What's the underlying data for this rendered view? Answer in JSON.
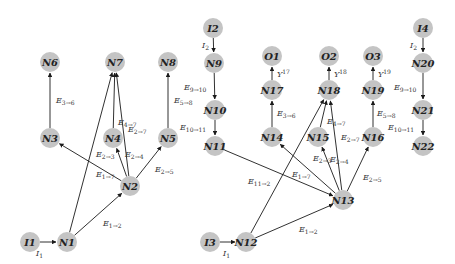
{
  "diagram": {
    "node_color": "#c4c4c4",
    "nodes": [
      {
        "id": "N6",
        "x": 50,
        "y": 62
      },
      {
        "id": "N7",
        "x": 115,
        "y": 62
      },
      {
        "id": "N8",
        "x": 168,
        "y": 62
      },
      {
        "id": "N3",
        "x": 50,
        "y": 138
      },
      {
        "id": "N4",
        "x": 113,
        "y": 138
      },
      {
        "id": "N5",
        "x": 168,
        "y": 138
      },
      {
        "id": "N2",
        "x": 130,
        "y": 186
      },
      {
        "id": "I1",
        "x": 30,
        "y": 242
      },
      {
        "id": "N1",
        "x": 67,
        "y": 242
      },
      {
        "id": "I2",
        "x": 213,
        "y": 28
      },
      {
        "id": "N9",
        "x": 214,
        "y": 63
      },
      {
        "id": "N10",
        "x": 215,
        "y": 110
      },
      {
        "id": "N11",
        "x": 215,
        "y": 146
      },
      {
        "id": "O1",
        "x": 272,
        "y": 56
      },
      {
        "id": "N17",
        "x": 272,
        "y": 90
      },
      {
        "id": "N14",
        "x": 272,
        "y": 137
      },
      {
        "id": "O2",
        "x": 329,
        "y": 56
      },
      {
        "id": "N18",
        "x": 329,
        "y": 90
      },
      {
        "id": "N15",
        "x": 318,
        "y": 137
      },
      {
        "id": "O3",
        "x": 373,
        "y": 56
      },
      {
        "id": "N19",
        "x": 373,
        "y": 90
      },
      {
        "id": "N16",
        "x": 373,
        "y": 137
      },
      {
        "id": "N13",
        "x": 343,
        "y": 200
      },
      {
        "id": "I3",
        "x": 210,
        "y": 242
      },
      {
        "id": "N12",
        "x": 246,
        "y": 242
      },
      {
        "id": "I4",
        "x": 423,
        "y": 28
      },
      {
        "id": "N20",
        "x": 423,
        "y": 63
      },
      {
        "id": "N21",
        "x": 423,
        "y": 110
      },
      {
        "id": "N22",
        "x": 423,
        "y": 146
      }
    ],
    "edges": [
      {
        "from": "I1",
        "to": "N1"
      },
      {
        "from": "N1",
        "to": "N2"
      },
      {
        "from": "N1",
        "to": "N7"
      },
      {
        "from": "N2",
        "to": "N3"
      },
      {
        "from": "N2",
        "to": "N4"
      },
      {
        "from": "N2",
        "to": "N5"
      },
      {
        "from": "N2",
        "to": "N7"
      },
      {
        "from": "N4",
        "to": "N7"
      },
      {
        "from": "N3",
        "to": "N6"
      },
      {
        "from": "N5",
        "to": "N8"
      },
      {
        "from": "I2",
        "to": "N9"
      },
      {
        "from": "N9",
        "to": "N10"
      },
      {
        "from": "N10",
        "to": "N11"
      },
      {
        "from": "N11",
        "to": "N13"
      },
      {
        "from": "I3",
        "to": "N12"
      },
      {
        "from": "N12",
        "to": "N13"
      },
      {
        "from": "N12",
        "to": "N18"
      },
      {
        "from": "N13",
        "to": "N14"
      },
      {
        "from": "N13",
        "to": "N15"
      },
      {
        "from": "N13",
        "to": "N16"
      },
      {
        "from": "N13",
        "to": "N18"
      },
      {
        "from": "N15",
        "to": "N18"
      },
      {
        "from": "N14",
        "to": "N17"
      },
      {
        "from": "N16",
        "to": "N19"
      },
      {
        "from": "N17",
        "to": "O1"
      },
      {
        "from": "N18",
        "to": "O2"
      },
      {
        "from": "N19",
        "to": "O3"
      },
      {
        "from": "I4",
        "to": "N20"
      },
      {
        "from": "N20",
        "to": "N21"
      },
      {
        "from": "N21",
        "to": "N22"
      }
    ],
    "labels": [
      {
        "base": "I",
        "sub": "1",
        "x": 36,
        "y": 256
      },
      {
        "base": "E",
        "sub": "1→2",
        "x": 103,
        "y": 226
      },
      {
        "base": "E",
        "sub": "1→7",
        "x": 96,
        "y": 177
      },
      {
        "base": "E",
        "sub": "2→3",
        "x": 96,
        "y": 157
      },
      {
        "base": "E",
        "sub": "2→4",
        "x": 125,
        "y": 157
      },
      {
        "base": "E",
        "sub": "2→5",
        "x": 155,
        "y": 172
      },
      {
        "base": "E",
        "sub": "4→7",
        "x": 118,
        "y": 125
      },
      {
        "base": "E",
        "sub": "2→7",
        "x": 128,
        "y": 132
      },
      {
        "base": "E",
        "sub": "3→6",
        "x": 56,
        "y": 103
      },
      {
        "base": "E",
        "sub": "5→8",
        "x": 174,
        "y": 103
      },
      {
        "base": "E",
        "sub": "9→10",
        "x": 184,
        "y": 90
      },
      {
        "base": "E",
        "sub": "10→11",
        "x": 180,
        "y": 130
      },
      {
        "base": "I",
        "sub": "2",
        "x": 202,
        "y": 48
      },
      {
        "base": "I",
        "sub": "1",
        "x": 223,
        "y": 256
      },
      {
        "base": "E",
        "sub": "1→2",
        "x": 299,
        "y": 232
      },
      {
        "base": "E",
        "sub": "11→2",
        "x": 248,
        "y": 184
      },
      {
        "base": "E",
        "sub": "1→7",
        "x": 292,
        "y": 177
      },
      {
        "base": "E",
        "sub": "2→3",
        "x": 313,
        "y": 161
      },
      {
        "base": "E",
        "sub": "2→4",
        "x": 330,
        "y": 162
      },
      {
        "base": "E",
        "sub": "2→5",
        "x": 363,
        "y": 180
      },
      {
        "base": "E",
        "sub": "3→6",
        "x": 277,
        "y": 116
      },
      {
        "base": "E",
        "sub": "4→7",
        "x": 327,
        "y": 124
      },
      {
        "base": "E",
        "sub": "2→7",
        "x": 341,
        "y": 140
      },
      {
        "base": "E",
        "sub": "5→8",
        "x": 377,
        "y": 116
      },
      {
        "base": "Y",
        "sup": "17",
        "x": 277,
        "y": 77
      },
      {
        "base": "Y",
        "sup": "18",
        "x": 334,
        "y": 77
      },
      {
        "base": "Y",
        "sup": "19",
        "x": 378,
        "y": 77
      },
      {
        "base": "I",
        "sub": "2",
        "x": 410,
        "y": 48
      },
      {
        "base": "E",
        "sub": "9→10",
        "x": 394,
        "y": 90
      },
      {
        "base": "E",
        "sub": "10→11",
        "x": 388,
        "y": 130
      }
    ]
  }
}
